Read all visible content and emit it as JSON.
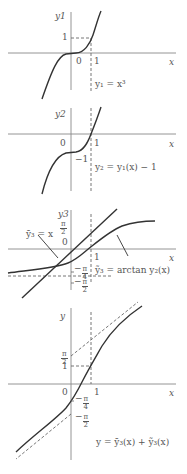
{
  "panels": [
    {
      "id": "panel-1",
      "y_axis_label": "y1",
      "x_axis_label": "x",
      "origin_label": "0",
      "x_tick_label": "1",
      "y_tick_label": "1",
      "curve_label": "y1 = x^3",
      "curve_label_text": "y₁ = x³"
    },
    {
      "id": "panel-2",
      "y_axis_label": "y2",
      "x_axis_label": "x",
      "origin_label": "0",
      "x_tick_label": "1",
      "y_tick_label": "−1",
      "curve_label_text": "y₂ = y₁(x) − 1"
    },
    {
      "id": "panel-3",
      "y_axis_label": "y3",
      "x_axis_label": "x",
      "origin_label": "0",
      "x_tick_label": "1",
      "y_tick_top": {
        "num": "π",
        "den": "2"
      },
      "y_tick_neg_quarter": {
        "sign": "−",
        "num": "π",
        "den": "4"
      },
      "y_tick_neg_half": {
        "sign": "−",
        "num": "π",
        "den": "2"
      },
      "line_label_text": "ȳ₃ = x",
      "curve_label_text": "ỹ₃ = arctan y₂(x)"
    },
    {
      "id": "panel-4",
      "y_axis_label": "y",
      "x_axis_label": "x",
      "origin_label": "0",
      "x_tick_label": "1",
      "y_tick_one": "1",
      "y_tick_half_pi": {
        "num": "π",
        "den": "2"
      },
      "y_tick_neg_quarter": {
        "sign": "−",
        "num": "π",
        "den": "4"
      },
      "y_tick_neg_half": {
        "sign": "−",
        "num": "π",
        "den": "2"
      },
      "curve_label_text": "y = ȳ₃(x) + ỹ₃(x)"
    }
  ],
  "colors": {
    "axis": "#777777",
    "curve": "#333333",
    "dashed": "#666666",
    "text": "#555555"
  }
}
